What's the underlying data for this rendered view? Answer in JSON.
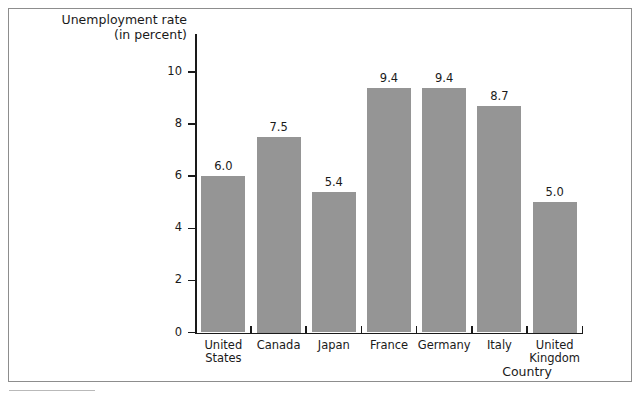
{
  "chart_data": {
    "type": "bar",
    "title": "",
    "categories": [
      "United States",
      "Canada",
      "Japan",
      "France",
      "Germany",
      "Italy",
      "United Kingdom"
    ],
    "values": [
      6.0,
      7.5,
      5.4,
      9.4,
      9.4,
      8.7,
      5.0
    ],
    "value_labels": [
      "6.0",
      "7.5",
      "5.4",
      "9.4",
      "9.4",
      "8.7",
      "5.0"
    ],
    "category_lines": [
      [
        "United",
        "States"
      ],
      [
        "Canada"
      ],
      [
        "Japan"
      ],
      [
        "France"
      ],
      [
        "Germany"
      ],
      [
        "Italy"
      ],
      [
        "United",
        "Kingdom"
      ]
    ],
    "xlabel": "Country",
    "ylabel": "Unemployment rate (in percent)",
    "ylabel_line1": "Unemployment rate",
    "ylabel_line2": "(in percent)",
    "ylim": [
      0,
      11
    ],
    "ytick_values": [
      0,
      2,
      4,
      6,
      8,
      10
    ],
    "ytick_labels": [
      "0",
      "2",
      "4",
      "6",
      "8",
      "10"
    ],
    "grid": false,
    "legend": false,
    "bar_color": "#959595",
    "axis_color": "#1a1a1a"
  }
}
